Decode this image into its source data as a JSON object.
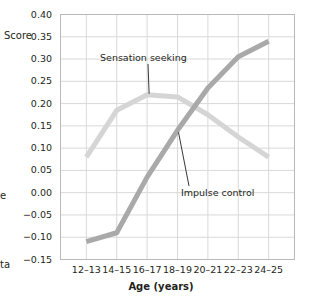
{
  "chart_data": {
    "type": "line",
    "title": "",
    "xlabel": "Age (years)",
    "ylabel": "Score",
    "categories": [
      "12–13",
      "14–15",
      "16–17",
      "18–19",
      "20–21",
      "22–23",
      "24–25"
    ],
    "ylim": [
      -0.15,
      0.4
    ],
    "ytick_labels": [
      "0.40",
      "0.35",
      "0.30",
      "0.25",
      "0.20",
      "0.15",
      "0.10",
      "0.05",
      "0.00",
      "−0.05",
      "−0.10",
      "−0.15"
    ],
    "ytick_values": [
      0.4,
      0.35,
      0.3,
      0.25,
      0.2,
      0.15,
      0.1,
      0.05,
      0.0,
      -0.05,
      -0.1,
      -0.15
    ],
    "grid": true,
    "legend_position": "inline-annotations",
    "series": [
      {
        "name": "Sensation seeking",
        "color": "#d5d5d5",
        "values": [
          0.08,
          0.185,
          0.22,
          0.215,
          0.175,
          0.125,
          0.08
        ]
      },
      {
        "name": "Impulse control",
        "color": "#a9a9a9",
        "values": [
          -0.11,
          -0.09,
          0.035,
          0.14,
          0.235,
          0.305,
          0.34
        ]
      }
    ],
    "annotations": [
      {
        "text": "Sensation seeking",
        "target_series": "Sensation seeking"
      },
      {
        "text": "Impulse control",
        "target_series": "Impulse control"
      }
    ]
  },
  "axes": {
    "y_label": "Score",
    "x_title": "Age (years)"
  },
  "clipped_text": {
    "left_fragment_1": "e",
    "left_fragment_2": "ta"
  }
}
